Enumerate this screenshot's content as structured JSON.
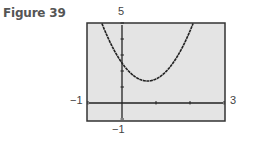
{
  "figure_label": "Figure 39",
  "chart_data": {
    "type": "line",
    "title": "",
    "xlabel": "",
    "ylabel": "",
    "xlim": [
      -1,
      3
    ],
    "ylim": [
      -1,
      5
    ],
    "window_labels": {
      "xmin": "−1",
      "xmax": "3",
      "ymin": "−1",
      "ymax": "5"
    },
    "x_ticks": [
      -1,
      0,
      1,
      2,
      3
    ],
    "y_ticks": [
      -1,
      0,
      1,
      2,
      3,
      4,
      5
    ],
    "grid": false,
    "series": [
      {
        "name": "parabola",
        "function": "2x^2 - 3x + 2.5",
        "coefficients": {
          "a": 2,
          "b": -3,
          "c": 2.5
        },
        "vertex": [
          0.75,
          1.375
        ]
      }
    ],
    "colors": {
      "screen": "#e4e4e4",
      "frame": "#333333",
      "curve": "#222222"
    }
  }
}
